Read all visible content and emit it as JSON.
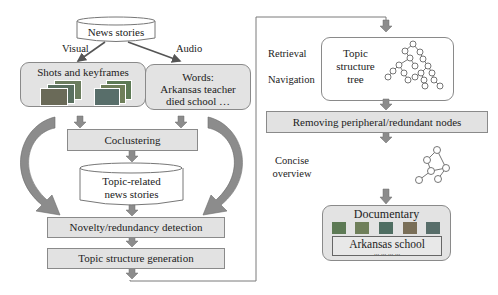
{
  "diagram": {
    "left_pipeline": {
      "source": {
        "label": "News stories",
        "shape": "cylinder"
      },
      "branch_labels": {
        "visual": "Visual",
        "audio": "Audio"
      },
      "visual_box": {
        "label": "Shots and keyframes"
      },
      "audio_box": {
        "line1": "Words:",
        "line2": "Arkansas teacher",
        "line3": "died school …"
      },
      "step_coclustering": "Coclustering",
      "topic_store": {
        "line1": "Topic-related",
        "line2": "news stories",
        "shape": "cylinder"
      },
      "step_novelty": "Novelty/redundancy detection",
      "step_generation": "Topic structure generation"
    },
    "right_pipeline": {
      "side_labels": {
        "retrieval": "Retrieval",
        "navigation": "Navigation",
        "concise_line1": "Concise",
        "concise_line2": "overview"
      },
      "topic_tree_box": {
        "line1": "Topic",
        "line2": "structure",
        "line3": "tree"
      },
      "step_removing": "Removing peripheral/redundant nodes",
      "main_thread_box": {
        "label": "Main thread tree"
      },
      "documentary_box": {
        "title": "Documentary",
        "caption": "Arkansas school",
        "ellipsis": "... ... ... ..."
      }
    },
    "colors": {
      "box_fill": "#e3e3e3",
      "box_border": "#8a8a8a",
      "arrow_fill": "#8c8c8c",
      "line": "#7a7a7a",
      "thumb_colors": [
        "#5d7a55",
        "#6f7f5a",
        "#4f6e62",
        "#7a6f58",
        "#586e6a"
      ]
    }
  }
}
